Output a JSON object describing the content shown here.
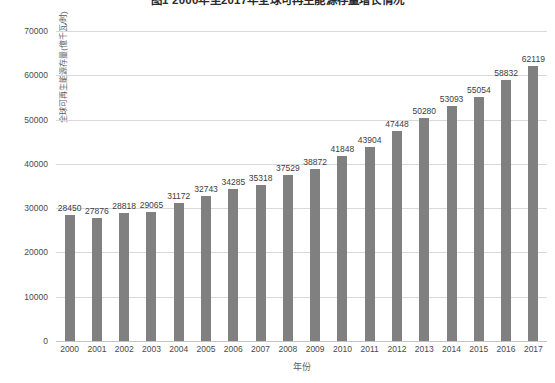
{
  "chart_data": {
    "type": "bar",
    "title": "图1  2000年至2017年全球可再生能源存量增长情况",
    "xlabel": "年份",
    "ylabel": "全球可再生能源存量(億千瓦/时)",
    "categories": [
      "2000",
      "2001",
      "2002",
      "2003",
      "2004",
      "2005",
      "2006",
      "2007",
      "2008",
      "2009",
      "2010",
      "2011",
      "2012",
      "2013",
      "2014",
      "2015",
      "2016",
      "2017"
    ],
    "values": [
      28450,
      27876,
      28818,
      29065,
      31172,
      32743,
      34285,
      35318,
      37529,
      38872,
      41848,
      43904,
      47448,
      50280,
      53093,
      55054,
      58832,
      62119
    ],
    "ylim": [
      0,
      70000
    ],
    "yticks": [
      0,
      10000,
      20000,
      30000,
      40000,
      50000,
      60000,
      70000
    ],
    "ytick_labels": [
      "0",
      "10000",
      "20000",
      "30000",
      "40000",
      "50000",
      "60000",
      "70000"
    ],
    "grid": true,
    "legend": false,
    "series_color": "#808080",
    "gridline_color": "#d9d9d9",
    "background": "#ffffff",
    "data_labels": true
  }
}
